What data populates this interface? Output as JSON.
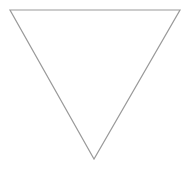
{
  "diagram": {
    "shape": "inverted-triangle",
    "points": [
      [
        10,
        10
      ],
      [
        180,
        10
      ],
      [
        94,
        159
      ]
    ],
    "stroke": "#9a9a9a",
    "stroke_width": 1.2,
    "fill": "#ffffff"
  }
}
